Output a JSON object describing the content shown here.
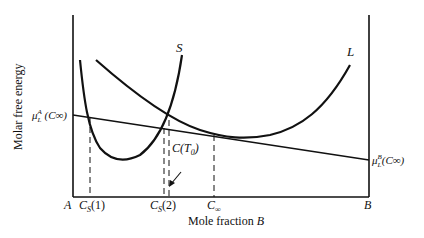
{
  "figure": {
    "y_axis_label": "Molar free energy",
    "x_axis_label_prefix": "Mole fraction ",
    "x_axis_label_var": "B",
    "x_left_label": "A",
    "x_right_label": "B",
    "curve_labels": {
      "solid": "S",
      "liquid": "L"
    },
    "tangent_left_label": {
      "mu": "μ",
      "sub": "L",
      "sup": "A",
      "arg": " (C∞)"
    },
    "tangent_right_label": {
      "mu": "μ",
      "sub": "L",
      "sup": "B",
      "arg": "(C∞)"
    },
    "tick_labels": [
      {
        "var": "C",
        "sub": "S",
        "arg": "(1)"
      },
      {
        "var": "C",
        "sub": "S",
        "arg": "(2)"
      },
      {
        "var": "C",
        "sub": "∞",
        "arg": ""
      }
    ],
    "annotation": {
      "text_prefix": "C(T",
      "sub": "0",
      "text_suffix": ")"
    }
  }
}
